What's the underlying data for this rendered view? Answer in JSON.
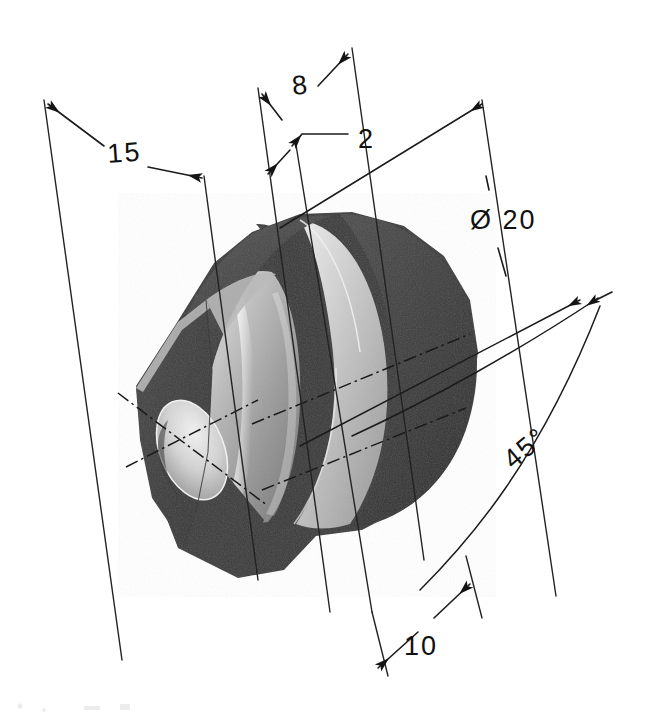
{
  "drawing": {
    "title": "Isometric dimensioned bushing",
    "subject": "hex-flanged cylindrical bushing with through bore",
    "background_color": "#ffffff",
    "ink_color": "#1b1b1b",
    "units_note": "",
    "dimensions": [
      {
        "id": "dim-15",
        "label": "15",
        "kind": "linear",
        "text_x": 108,
        "text_y": 163,
        "description": "overall length across flange and body"
      },
      {
        "id": "dim-8",
        "label": "8",
        "kind": "linear",
        "text_x": 293,
        "text_y": 95,
        "description": "body length to flange face"
      },
      {
        "id": "dim-2",
        "label": "2",
        "kind": "linear-leader",
        "text_x": 358,
        "text_y": 148,
        "description": "flange band thickness"
      },
      {
        "id": "dim-dia20",
        "label": "Ø 20",
        "kind": "diameter",
        "text_x": 470,
        "text_y": 229,
        "description": "flange outside diameter"
      },
      {
        "id": "dim-10",
        "label": "10",
        "kind": "linear",
        "text_x": 404,
        "text_y": 655,
        "description": "bore / body diameter across flats"
      },
      {
        "id": "dim-45deg",
        "label": "45°",
        "kind": "angular",
        "text_x": 513,
        "text_y": 470,
        "description": "hexagon chamfer angle"
      }
    ],
    "part": {
      "name": "hex-flanged-bushing",
      "features": [
        "hexagonal end face",
        "cylindrical outer body",
        "raised circular flange",
        "through bore",
        "centerline crosshair on bore"
      ],
      "shading": {
        "dark_face": "#3d3d3d",
        "mid_face": "#8d8d8d",
        "light_face": "#d4d4d4",
        "highlight": "#f0f0f0",
        "deep_shadow": "#2e2e2e"
      }
    }
  }
}
